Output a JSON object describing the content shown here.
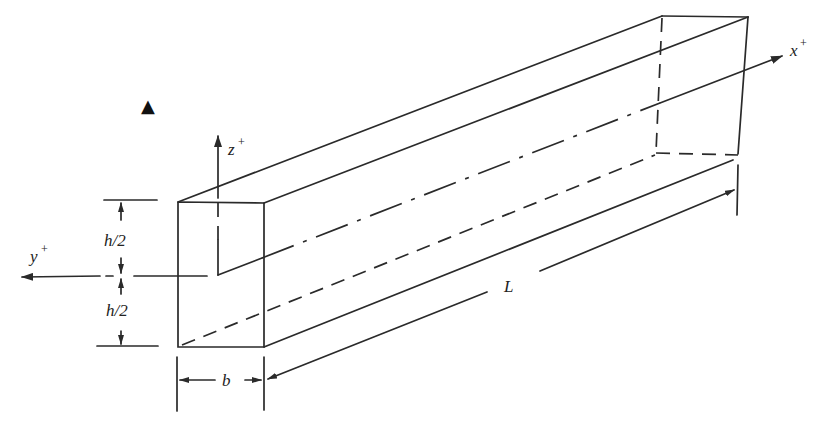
{
  "diagram": {
    "type": "isometric-beam",
    "axes": {
      "x": {
        "label": "x",
        "sup": "+"
      },
      "y": {
        "label": "y",
        "sup": "+"
      },
      "z": {
        "label": "z",
        "sup": "+"
      }
    },
    "dimensions": {
      "half_height_top": "h/2",
      "half_height_bottom": "h/2",
      "width": "b",
      "length": "L"
    },
    "marker": "▲",
    "colors": {
      "ink": "#2a2a2a",
      "background": "#ffffff"
    }
  }
}
